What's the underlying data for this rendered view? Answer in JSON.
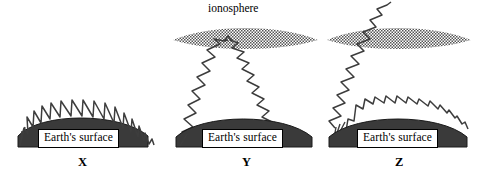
{
  "figure": {
    "title_visible": false,
    "background_color": "#ffffff",
    "width": 487,
    "height": 176
  },
  "labels": {
    "ionosphere": "ionosphere",
    "earth_surface": "Earth's surface"
  },
  "colors": {
    "ink": "#333333",
    "earth_fill": "#3a3a3a",
    "ionosphere_dots": "#555555",
    "box_background": "#ffffff",
    "box_border": "#000000",
    "text": "#000000"
  },
  "panels": [
    {
      "id": "x",
      "letter": "X",
      "surface_label": "Earth's surface",
      "has_ionosphere": false,
      "waves": [
        "ground-wave"
      ],
      "description": "Ground wave following the curvature of Earth's surface"
    },
    {
      "id": "y",
      "letter": "Y",
      "surface_label": "Earth's surface",
      "ionosphere_label": "ionosphere",
      "has_ionosphere": true,
      "waves": [
        "sky-wave-up",
        "sky-wave-down"
      ],
      "description": "Sky wave reflected from the ionosphere back to Earth"
    },
    {
      "id": "z",
      "letter": "Z",
      "surface_label": "Earth's surface",
      "has_ionosphere": true,
      "waves": [
        "sky-wave-penetrating",
        "ground-wave"
      ],
      "description": "Sky wave penetrating through the ionosphere plus a ground wave"
    }
  ]
}
